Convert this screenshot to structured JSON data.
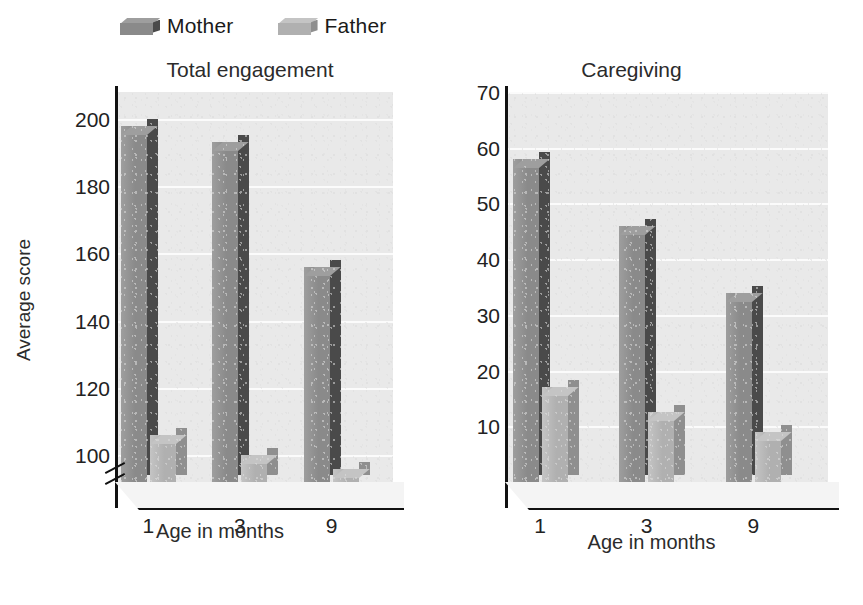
{
  "legend": {
    "entries": [
      {
        "label": "Mother",
        "color": "#8a8a8a",
        "side_color": "#4a4a4a",
        "top_color": "#9e9e9e"
      },
      {
        "label": "Father",
        "color": "#b0b0b0",
        "side_color": "#8f8f8f",
        "top_color": "#c4c4c4"
      }
    ]
  },
  "chart_data": [
    {
      "type": "bar",
      "title": "Total engagement",
      "xlabel": "Age in months",
      "ylabel": "Average score",
      "categories": [
        "1",
        "3",
        "9"
      ],
      "series": [
        {
          "name": "Mother",
          "values": [
            198,
            193,
            156
          ]
        },
        {
          "name": "Father",
          "values": [
            106,
            100,
            96
          ]
        }
      ],
      "yticks": [
        100,
        120,
        140,
        160,
        180,
        200
      ],
      "ylim": [
        92,
        208
      ],
      "axis_break": true,
      "grid": true,
      "legend_position": "top"
    },
    {
      "type": "bar",
      "title": "Caregiving",
      "xlabel": "Age in months",
      "ylabel": "",
      "categories": [
        "1",
        "3",
        "9"
      ],
      "series": [
        {
          "name": "Mother",
          "values": [
            58,
            46,
            34
          ]
        },
        {
          "name": "Father",
          "values": [
            17,
            12.5,
            9
          ]
        }
      ],
      "yticks": [
        10,
        20,
        30,
        40,
        50,
        60,
        70
      ],
      "ylim": [
        0,
        70
      ],
      "axis_break": false,
      "grid": true,
      "legend_position": "top"
    }
  ]
}
